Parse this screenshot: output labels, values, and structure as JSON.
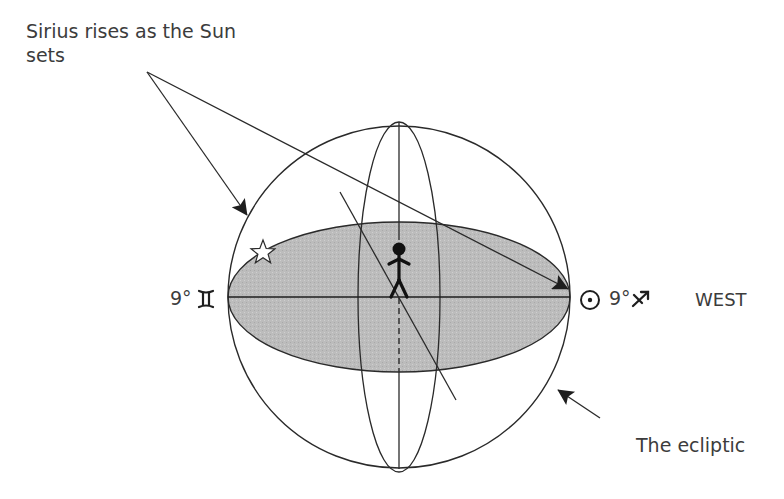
{
  "annotations": {
    "sirius_callout": "Sirius rises as the Sun sets",
    "left_position": "9°♊",
    "right_position": "9°♐",
    "direction": "WEST",
    "ecliptic_callout": "The ecliptic"
  },
  "symbols": {
    "left_sign": "gemini-glyph",
    "right_sign": "sagittarius-glyph",
    "sun": "sun-symbol",
    "star": "sirius-star",
    "observer": "stick-figure"
  },
  "colors": {
    "line": "#2a2a2a",
    "ellipse_fill": "#bdbdbd",
    "text": "#3c3c3c",
    "background": "#ffffff"
  }
}
